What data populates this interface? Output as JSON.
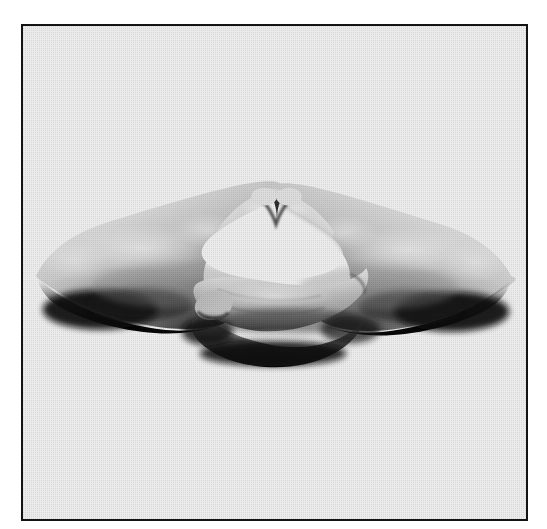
{
  "page": {
    "background_color": "#ffffff",
    "width": 547,
    "height": 529
  },
  "frame": {
    "name": "photo-frame",
    "border_color": "#131313",
    "border_width_px": 2,
    "fill_color": "#ffffff",
    "left_px": 21,
    "top_px": 24,
    "width_px": 507,
    "height_px": 497
  },
  "photo": {
    "alt_text": "Black and white halftone photograph of two cupped hands resting one atop the other with thumb tips touching, forming an oval opening — a meditation mudra",
    "subject": "two hands forming a meditation mudra",
    "style": "halftone screened black-and-white print",
    "orientation": "horizontal, hands span nearly the full width of the frame",
    "background_color": "#ffffff",
    "tone_colors": {
      "highlight": "#f4f4f4",
      "light_midtone": "#d8d8d8",
      "midtone": "#b4b4b4",
      "dark_midtone": "#7a7a7a",
      "shadow": "#2e2e2e",
      "deep_shadow": "#0d0d0d"
    },
    "elements": [
      {
        "name": "left-forearm-wrist",
        "description": "left forearm entering from the left edge, dark shadow along its underside"
      },
      {
        "name": "left-hand-back",
        "description": "back of the left hand angling up and to the right toward the thumb"
      },
      {
        "name": "left-thumb",
        "description": "left thumb rising to meet the right thumb at the top center"
      },
      {
        "name": "thumb-tip-contact",
        "description": "point where the two thumb tips touch at the apex of the oval"
      },
      {
        "name": "inner-oval-void",
        "description": "bright white oval opening enclosed between the thumbs above and the fingers below"
      },
      {
        "name": "right-thumb",
        "description": "right thumb rising to meet the left thumb at the top center"
      },
      {
        "name": "right-hand-back",
        "description": "back of the right hand sloping down and to the right"
      },
      {
        "name": "right-forearm-wrist",
        "description": "right forearm exiting to the right edge, dark shadow along its underside"
      },
      {
        "name": "lower-hand-fingers",
        "description": "fingers of the lower hand lying across the upper palm, forming the base of the oval"
      },
      {
        "name": "lower-hand-edge",
        "description": "shadowed outer edge of the lower hand along the bottom of the gesture"
      }
    ]
  },
  "caption": {
    "visible": false,
    "text": ""
  }
}
